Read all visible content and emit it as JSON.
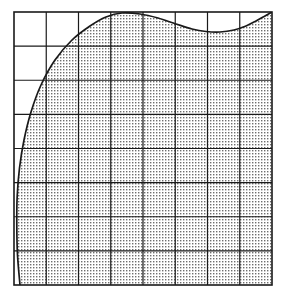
{
  "figure": {
    "title": "",
    "type": "shaded-region-over-grid",
    "canvas": {
      "width": 292,
      "height": 300,
      "background": "#ffffff"
    },
    "plot_area": {
      "x_left": 14,
      "x_right": 272,
      "y_top": 12,
      "y_bottom": 285,
      "width": 258,
      "height": 273
    },
    "grid": {
      "columns": 8,
      "rows": 8,
      "cell_width": 32.25,
      "cell_height": 34.125,
      "line_color": "#1a1a1a",
      "line_width": 1.2,
      "border_color": "#1a1a1a",
      "border_width": 1.6,
      "vertical_lines": [
        14,
        46.25,
        78.5,
        110.75,
        143,
        175.25,
        207.5,
        239.75,
        272
      ],
      "horizontal_lines": [
        12,
        46.125,
        80.25,
        114.375,
        148.5,
        182.625,
        216.75,
        250.875,
        285
      ]
    },
    "shaded_region": {
      "fill_pattern": "halftone-dot-stipple",
      "fill_color": "#6e6e6e",
      "fill_background": "#ffffff",
      "pattern_size_px": 3,
      "dot_size_px": 1.4,
      "outline_color": "#1a1a1a",
      "outline_width": 1.7,
      "description": "Curve starts at bottom-left, bulges left through mid-height, rises steeply to a broad peak touching the top border near the left-of-centre, dips to a shallow minimum right-of-centre, then rises back to the top-right corner.",
      "boundary_points": [
        {
          "x": 20,
          "y": 285
        },
        {
          "x": 17.5,
          "y": 255
        },
        {
          "x": 16.8,
          "y": 225
        },
        {
          "x": 17.2,
          "y": 196
        },
        {
          "x": 19.5,
          "y": 168
        },
        {
          "x": 24,
          "y": 140
        },
        {
          "x": 31,
          "y": 112
        },
        {
          "x": 41,
          "y": 85
        },
        {
          "x": 55,
          "y": 60
        },
        {
          "x": 72,
          "y": 40
        },
        {
          "x": 90,
          "y": 26
        },
        {
          "x": 106,
          "y": 17
        },
        {
          "x": 122,
          "y": 13
        },
        {
          "x": 140,
          "y": 14
        },
        {
          "x": 158,
          "y": 18
        },
        {
          "x": 176,
          "y": 24
        },
        {
          "x": 192,
          "y": 29
        },
        {
          "x": 206,
          "y": 31.5
        },
        {
          "x": 220,
          "y": 32
        },
        {
          "x": 234,
          "y": 30
        },
        {
          "x": 246,
          "y": 26
        },
        {
          "x": 256,
          "y": 21
        },
        {
          "x": 265,
          "y": 16
        },
        {
          "x": 272,
          "y": 12
        }
      ]
    },
    "axes": {
      "x_tick_labels": [],
      "y_tick_labels": [],
      "xlabel": "",
      "ylabel": "",
      "legend": []
    }
  },
  "chart_data": {
    "type": "area",
    "title": "",
    "xlabel": "",
    "ylabel": "",
    "grid": true,
    "legend_position": "none",
    "xlim": [
      14,
      272
    ],
    "ylim": [
      12,
      285
    ],
    "x_tick_labels": [],
    "y_tick_labels": [],
    "series": [
      {
        "name": "shaded-region-boundary",
        "fill": "halftone-dot-stipple",
        "x": [
          20,
          17.5,
          16.8,
          17.2,
          19.5,
          24,
          31,
          41,
          55,
          72,
          90,
          106,
          122,
          140,
          158,
          176,
          192,
          206,
          220,
          234,
          246,
          256,
          265,
          272
        ],
        "y": [
          285,
          255,
          225,
          196,
          168,
          140,
          112,
          85,
          60,
          40,
          26,
          17,
          13,
          14,
          18,
          24,
          29,
          31.5,
          32,
          30,
          26,
          21,
          16,
          12
        ]
      }
    ]
  }
}
